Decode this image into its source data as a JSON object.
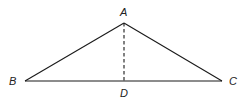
{
  "diagram": {
    "type": "triangle-with-altitude",
    "stroke_color": "#1a1a1a",
    "background": "#ffffff",
    "points": {
      "A": {
        "label": "A",
        "x": 124,
        "y": 23
      },
      "B": {
        "label": "B",
        "x": 25,
        "y": 81
      },
      "C": {
        "label": "C",
        "x": 222,
        "y": 81
      },
      "D": {
        "label": "D",
        "x": 124,
        "y": 81
      }
    },
    "segments": [
      {
        "from": "A",
        "to": "B",
        "style": "solid"
      },
      {
        "from": "A",
        "to": "C",
        "style": "solid"
      },
      {
        "from": "B",
        "to": "C",
        "style": "solid"
      },
      {
        "from": "A",
        "to": "D",
        "style": "dashed"
      }
    ]
  }
}
